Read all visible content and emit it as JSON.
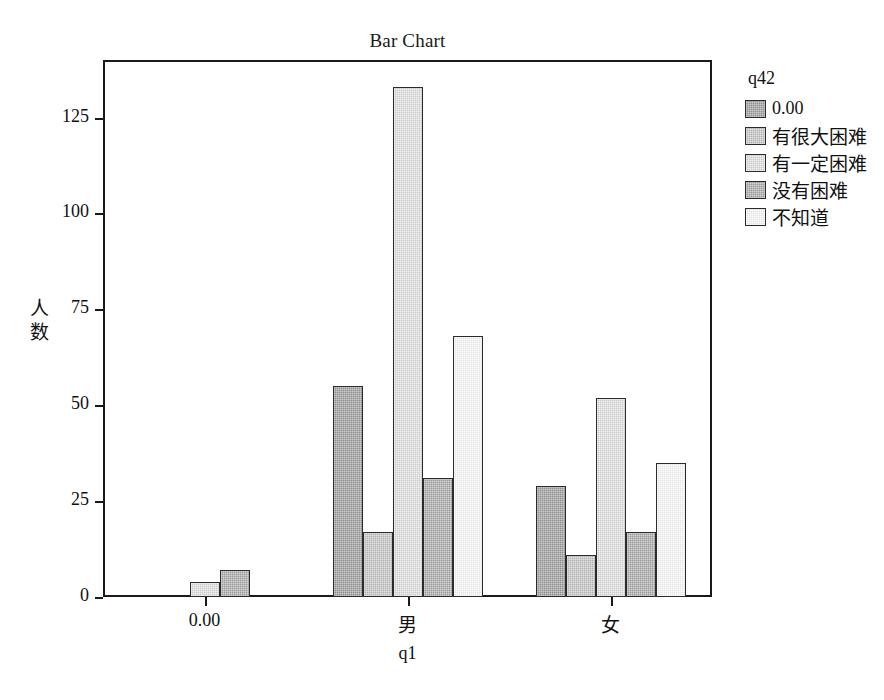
{
  "chart_data": {
    "type": "bar",
    "title": "Bar Chart",
    "xlabel": "q1",
    "ylabel": "人数",
    "categories": [
      "0.00",
      "男",
      "女"
    ],
    "legend_title": "q42",
    "legend_position": "right",
    "grid": false,
    "ylim": [
      0,
      140
    ],
    "yticks": [
      0,
      25,
      50,
      75,
      100,
      125
    ],
    "ytick_labels": [
      "0",
      "25",
      "50",
      "75",
      "100",
      "125"
    ],
    "series": [
      {
        "name": "0.00",
        "color": "#8f8f8f",
        "values": [
          0,
          55,
          29
        ]
      },
      {
        "name": "有很大困难",
        "color": "#b0b0b0",
        "values": [
          0,
          17,
          11
        ]
      },
      {
        "name": "有一定困难",
        "color": "#c9c9c9",
        "values": [
          4,
          133,
          52
        ]
      },
      {
        "name": "没有困难",
        "color": "#9a9a9a",
        "values": [
          7,
          31,
          17
        ]
      },
      {
        "name": "不知道",
        "color": "#e4e4e4",
        "values": [
          0,
          68,
          35
        ]
      }
    ]
  }
}
